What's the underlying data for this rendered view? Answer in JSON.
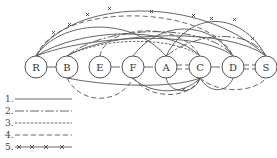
{
  "diagram": {
    "nodes": [
      {
        "id": "R",
        "label": "R",
        "cx": 36,
        "cy": 67
      },
      {
        "id": "B",
        "label": "B",
        "cx": 67,
        "cy": 67
      },
      {
        "id": "E",
        "label": "E",
        "cx": 100,
        "cy": 67
      },
      {
        "id": "F",
        "label": "F",
        "cx": 133,
        "cy": 67
      },
      {
        "id": "A",
        "label": "A",
        "cx": 166,
        "cy": 67
      },
      {
        "id": "C",
        "label": "C",
        "cx": 200,
        "cy": 67
      },
      {
        "id": "D",
        "label": "D",
        "cx": 233,
        "cy": 67
      },
      {
        "id": "S",
        "label": "S",
        "cx": 266,
        "cy": 67
      }
    ],
    "node_radius": 11,
    "stroke_color": "#555555"
  },
  "legend": {
    "items": [
      {
        "number": "1.",
        "style": "solid"
      },
      {
        "number": "2.",
        "style": "dash-dot"
      },
      {
        "number": "3.",
        "style": "fine-dashed"
      },
      {
        "number": "4.",
        "style": "dashed"
      },
      {
        "number": "5.",
        "style": "crossed"
      }
    ]
  }
}
